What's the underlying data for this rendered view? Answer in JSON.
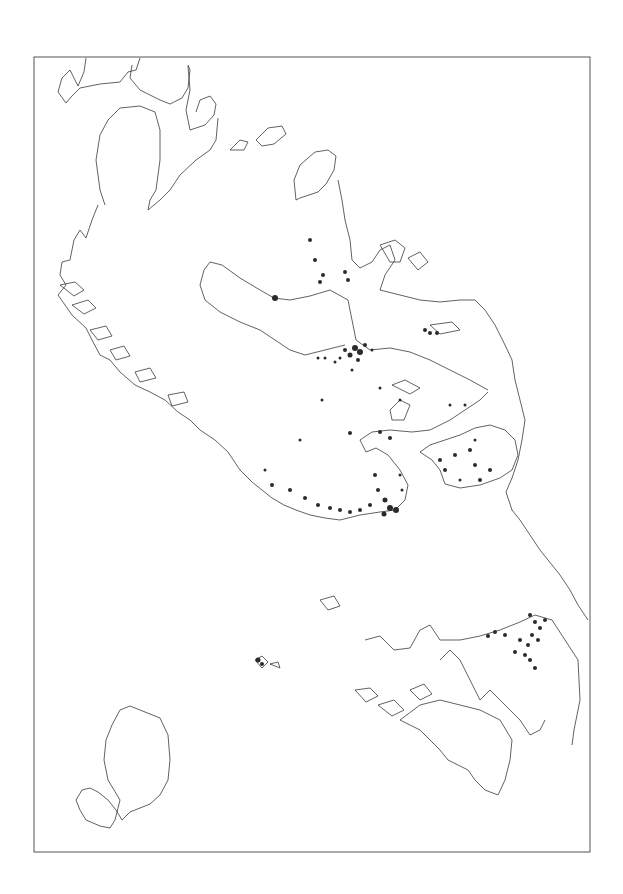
{
  "map": {
    "type": "distribution-map",
    "labels": [],
    "frame": {
      "x": 34,
      "y": 57,
      "width": 556,
      "height": 795
    },
    "colors": {
      "background": "#ffffff",
      "coastline": "#3a3a3a",
      "frame": "#555555",
      "markers": "#2a2a2a"
    },
    "regions": [
      {
        "name": "northern-peninsula-coast",
        "visible": true
      },
      {
        "name": "western-fjord-coast",
        "visible": true
      },
      {
        "name": "central-landmass",
        "visible": true
      },
      {
        "name": "eastern-coast",
        "visible": true
      },
      {
        "name": "southern-peninsula",
        "visible": true
      },
      {
        "name": "southeast-island-group",
        "visible": true
      },
      {
        "name": "southwest-island",
        "visible": true
      },
      {
        "name": "small-central-islands",
        "visible": true
      }
    ],
    "marker_clusters": [
      {
        "area": "central-upper",
        "approx_x": 355,
        "approx_y": 350,
        "count_estimate": 40
      },
      {
        "area": "south-coast-of-central-landmass",
        "approx_x": 380,
        "approx_y": 520,
        "count_estimate": 60
      },
      {
        "area": "eastern-inlet",
        "approx_x": 460,
        "approx_y": 460,
        "count_estimate": 30
      },
      {
        "area": "southeast-peninsula",
        "approx_x": 535,
        "approx_y": 630,
        "count_estimate": 35
      },
      {
        "area": "northern-islands",
        "approx_x": 320,
        "approx_y": 250,
        "count_estimate": 20
      },
      {
        "area": "west-lake-head",
        "approx_x": 275,
        "approx_y": 298,
        "count_estimate": 1
      },
      {
        "area": "small-island-cluster",
        "approx_x": 258,
        "approx_y": 660,
        "count_estimate": 5
      }
    ]
  }
}
